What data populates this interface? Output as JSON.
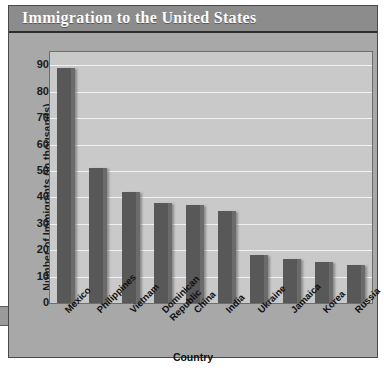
{
  "figure": {
    "title": "Immigration to the United States"
  },
  "chart_data": {
    "type": "bar",
    "title": "Immigration to the United States",
    "xlabel": "Country",
    "ylabel": "Number of Immigrants (in thousands)",
    "categories": [
      "Mexico",
      "Philippines",
      "Vietnam",
      "Dominican\nRepublic",
      "China",
      "India",
      "Ukraine",
      "Jamaica",
      "Korea",
      "Russia"
    ],
    "values": [
      89,
      51,
      42,
      38,
      37,
      35,
      18,
      16.5,
      15.5,
      14.5
    ],
    "ylim": [
      0,
      95
    ],
    "yticks": [
      0,
      10,
      20,
      30,
      40,
      50,
      60,
      70,
      80,
      90
    ],
    "ytick_labels": [
      "0",
      "10",
      "20",
      "30",
      "40",
      "50",
      "60",
      "70",
      "80",
      "90"
    ],
    "grid": true,
    "legend": "none",
    "bar_color": "#585858",
    "plot_background": "#c9c9c9",
    "gridline_color": "#f2f2f2"
  }
}
